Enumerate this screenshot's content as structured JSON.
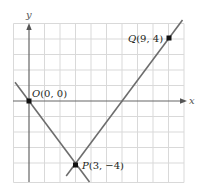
{
  "figure": {
    "x_axis_label": "x",
    "y_axis_label": "y",
    "grid": {
      "x_min": -1,
      "x_max": 10,
      "y_min": -5,
      "y_max": 5,
      "step": 1,
      "color": "#d9d9d9"
    },
    "colors": {
      "axis": "#666666",
      "line": "#6d6d6d",
      "point": "#111111",
      "text": "#231f20"
    },
    "points": [
      {
        "name": "O",
        "x": 0,
        "y": 0,
        "label": "O(0, 0)"
      },
      {
        "name": "P",
        "x": 3,
        "y": -4,
        "label": "P(3, −4)"
      },
      {
        "name": "Q",
        "x": 9,
        "y": 4,
        "label": "Q(9, 4)"
      }
    ],
    "lines": [
      {
        "name": "line-OP",
        "from": [
          -0.9,
          1.2
        ],
        "to": [
          3.9,
          -5.2
        ]
      },
      {
        "name": "line-PQ",
        "from": [
          2.4,
          -4.8
        ],
        "to": [
          9.9,
          5.2
        ]
      }
    ]
  }
}
